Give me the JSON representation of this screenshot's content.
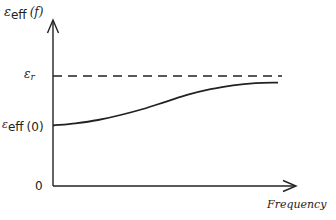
{
  "chart_data": {
    "type": "line",
    "title": "",
    "xlabel": "Frequency",
    "ylabel": "ε_eff (f)",
    "ylabel_parts": {
      "symbol": "ε",
      "sub": "eff",
      "arg": "(f)"
    },
    "y_ticks": [
      {
        "label": "0",
        "symbol": "",
        "sub": "",
        "arg": "0",
        "value": 0
      },
      {
        "label": "ε_eff (0)",
        "symbol": "ε",
        "sub": "eff",
        "arg": "(0)",
        "value": 0.55
      },
      {
        "label": "ε_r",
        "symbol": "ε",
        "sub": "r",
        "arg": "",
        "value": 1.0
      }
    ],
    "reference_line": {
      "label": "ε_r",
      "style": "dashed",
      "value": 1.0
    },
    "series": [
      {
        "name": "ε_eff(f)",
        "style": "solid",
        "x": [
          0,
          0.1,
          0.2,
          0.3,
          0.4,
          0.5,
          0.6,
          0.7,
          0.8,
          0.9,
          1.0
        ],
        "values": [
          0.55,
          0.57,
          0.6,
          0.645,
          0.7,
          0.765,
          0.83,
          0.88,
          0.915,
          0.935,
          0.94
        ]
      }
    ],
    "grid": false,
    "legend": null
  },
  "colors": {
    "ink": "#222222",
    "background": "#ffffff"
  }
}
